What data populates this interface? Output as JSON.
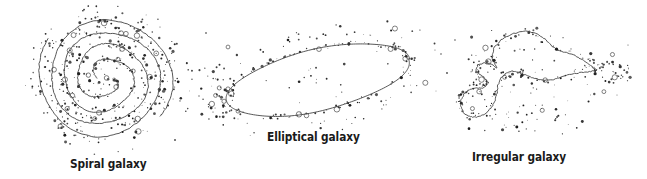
{
  "figure": {
    "title": "",
    "background_color": "#ffffff",
    "ink_color": "#3a3a3a",
    "label_color": "#1a1a1a",
    "kind": "scientific-illustration"
  },
  "galaxies": [
    {
      "id": "spiral",
      "label": "Spiral galaxy",
      "shape": "spiral",
      "center": [
        105,
        78
      ],
      "radius": 66,
      "arms": 2,
      "turns": 2.1,
      "star_count": 420,
      "label_position": [
        70,
        157
      ]
    },
    {
      "id": "elliptical",
      "label": "Elliptical galaxy",
      "shape": "ellipse",
      "center": [
        318,
        80
      ],
      "semi_major": 92,
      "semi_minor": 31,
      "rotation_deg": -13,
      "star_count": 170,
      "label_position": [
        267,
        130
      ]
    },
    {
      "id": "irregular",
      "label": "Irregular galaxy",
      "shape": "irregular-blob",
      "center": [
        528,
        75
      ],
      "star_count": 230,
      "label_position": [
        472,
        150
      ]
    }
  ],
  "labels": {
    "spiral": "Spiral galaxy",
    "elliptical": "Elliptical galaxy",
    "irregular": "Irregular galaxy"
  }
}
